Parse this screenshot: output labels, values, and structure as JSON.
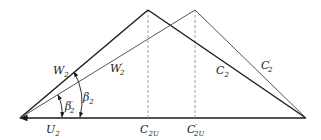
{
  "diagram": {
    "colors": {
      "line": "#1a1a1a",
      "primed": "#555555",
      "dashed": "#888888",
      "background": "#ffffff"
    },
    "labels": {
      "W2": {
        "main": "W",
        "sub": "2",
        "prime": ""
      },
      "W2p": {
        "main": "W",
        "sub": "2",
        "prime": "′"
      },
      "C2": {
        "main": "C",
        "sub": "2",
        "prime": ""
      },
      "C2p": {
        "main": "C",
        "sub": "2",
        "prime": "′"
      },
      "U2": {
        "main": "U",
        "sub": "2",
        "prime": ""
      },
      "C2U": {
        "main": "C",
        "sub": "2U",
        "prime": ""
      },
      "C2Up": {
        "main": "C",
        "sub": "2U",
        "prime": "′"
      },
      "beta2": {
        "main": "β",
        "sub": "2",
        "prime": ""
      },
      "beta2p": {
        "main": "β",
        "sub": "2",
        "prime": "′"
      }
    }
  }
}
